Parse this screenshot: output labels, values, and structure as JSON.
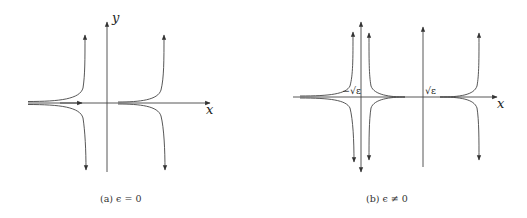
{
  "figure": {
    "panels": [
      {
        "id": "a",
        "caption": "(a) ϵ = 0",
        "axis_labels": {
          "x": "x",
          "y": "y"
        },
        "description": "Flow with two branches of hyperbola-like curves on either side of the y-axis; trajectories approach x-axis from left and diverge vertically near asymptotes"
      },
      {
        "id": "b",
        "caption": "(b) ϵ ≠ 0",
        "axis_labels": {
          "x": "x"
        },
        "point_labels": [
          "−√ε",
          "√ε"
        ],
        "description": "Flow with fixed points at −√ε and √ε on the x-axis; curves diverge vertically near three asymptotes"
      }
    ]
  }
}
